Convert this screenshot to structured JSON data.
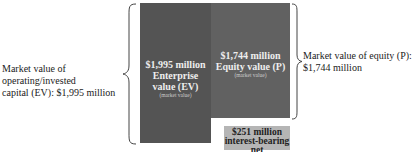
{
  "diagram": {
    "left_label": [
      "Market value of operating/invested",
      "capital (EV): $1,995 million"
    ],
    "right_label": [
      "Market value of equity (P):",
      "$1,744 million"
    ],
    "ev_box": {
      "amount": "$1,995 million",
      "title_line1": "Enterprise",
      "title_line2": "value (EV)",
      "note": "(market value)",
      "color": "#545454"
    },
    "equity_box": {
      "amount": "$1,744 million",
      "title": "Equity value (P)",
      "note": "(market value)",
      "color": "#616161"
    },
    "debt_box": {
      "amount": "$251 million",
      "title_line1": "interest-bearing net",
      "title_line2": "debt",
      "note": "(market value)",
      "color": "#b5b5b5"
    }
  }
}
